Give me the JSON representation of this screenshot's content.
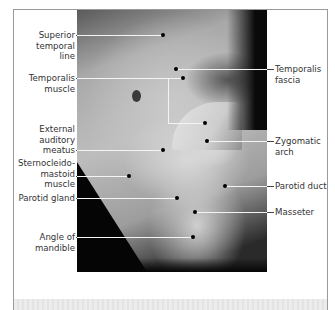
{
  "figure": {
    "photo_description": "grayscale dissection photograph, lateral view of head showing temporal region and face",
    "colors": {
      "label_text": "#333333",
      "leader_line_outside": "#444444",
      "leader_line_inside": "#f4f4f4",
      "dot": "#000000",
      "frame": "#9a9a9a"
    }
  },
  "labels": [
    {
      "id": "superior-temporal-line",
      "text": "Superior\ntemporal line",
      "side": "left",
      "x": 20,
      "y": 30,
      "w": 55,
      "line_y": 35,
      "dot": [
        163,
        35
      ],
      "bend": null
    },
    {
      "id": "temporalis-muscle",
      "text": "Temporalis\nmuscle",
      "side": "left",
      "x": 20,
      "y": 73,
      "w": 55,
      "line_y": 78,
      "dot": [
        183,
        78
      ],
      "bend": [
        168,
        78,
        168,
        123,
        205,
        123
      ]
    },
    {
      "id": "external-auditory-meatus",
      "text": "External\nauditory\nmeatus",
      "side": "left",
      "x": 20,
      "y": 124,
      "w": 55,
      "line_y": 150,
      "dot": [
        163,
        150
      ],
      "bend": null
    },
    {
      "id": "sternocleidomastoid-muscle",
      "text": "Sternocleido-\nmastoid\nmuscle",
      "side": "left",
      "x": 16,
      "y": 158,
      "w": 59,
      "line_y": 176,
      "dot": [
        129,
        176
      ],
      "bend": null
    },
    {
      "id": "parotid-gland",
      "text": "Parotid gland",
      "side": "left",
      "x": 10,
      "y": 193,
      "w": 65,
      "line_y": 198,
      "dot": [
        177,
        198
      ],
      "bend": null
    },
    {
      "id": "angle-of-mandible",
      "text": "Angle of\nmandible",
      "side": "left",
      "x": 20,
      "y": 232,
      "w": 55,
      "line_y": 237,
      "dot": [
        193,
        237
      ],
      "bend": null
    },
    {
      "id": "temporalis-fascia",
      "text": "Temporalis\nfascia",
      "side": "right",
      "x": 275,
      "y": 64,
      "w": 55,
      "line_y": 69,
      "dot": [
        176,
        69
      ],
      "bend": null
    },
    {
      "id": "zygomatic-arch",
      "text": "Zygomatic\narch",
      "side": "right",
      "x": 275,
      "y": 136,
      "w": 55,
      "line_y": 141,
      "dot": [
        207,
        141
      ],
      "bend": null
    },
    {
      "id": "parotid-duct",
      "text": "Parotid duct",
      "side": "right",
      "x": 275,
      "y": 181,
      "w": 60,
      "line_y": 186,
      "dot": [
        225,
        186
      ],
      "bend": null
    },
    {
      "id": "masseter",
      "text": "Masseter",
      "side": "right",
      "x": 275,
      "y": 207,
      "w": 55,
      "line_y": 212,
      "dot": [
        195,
        212
      ],
      "bend": null
    }
  ]
}
